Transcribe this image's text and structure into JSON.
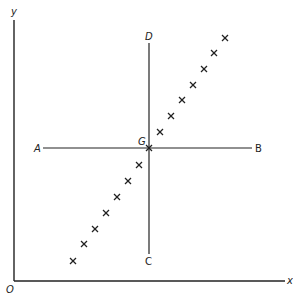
{
  "diagram": {
    "axes": {
      "origin_label": "O",
      "x_label": "x",
      "y_label": "y",
      "origin": [
        14,
        281
      ],
      "x_end": [
        285,
        281
      ],
      "y_end": [
        14,
        20
      ]
    },
    "vertical_line": {
      "top_label": "D",
      "bottom_label": "C",
      "x": 149,
      "y1": 43,
      "y2": 254
    },
    "horizontal_line": {
      "left_label": "A",
      "right_label": "B",
      "y": 148,
      "x1": 43,
      "x2": 252
    },
    "center": {
      "label": "G",
      "point": [
        149,
        148
      ]
    },
    "points": [
      [
        73,
        261
      ],
      [
        84,
        244
      ],
      [
        95,
        229
      ],
      [
        106,
        213
      ],
      [
        117,
        197
      ],
      [
        128,
        181
      ],
      [
        139,
        165
      ],
      [
        149,
        148
      ],
      [
        160,
        132
      ],
      [
        171,
        116
      ],
      [
        182,
        100
      ],
      [
        193,
        85
      ],
      [
        204,
        69
      ],
      [
        214,
        53
      ],
      [
        225,
        38
      ]
    ],
    "colors": {
      "ink": "#222222",
      "background": "#ffffff"
    }
  }
}
